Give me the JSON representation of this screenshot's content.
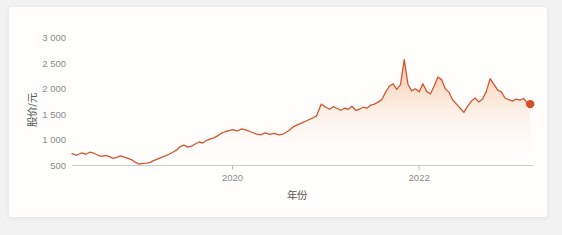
{
  "card": {
    "background": "#fffefd",
    "border_color": "#efeae6"
  },
  "chart_data": {
    "type": "line",
    "title": "",
    "subtitle": "",
    "xlabel": "年份",
    "ylabel": "股价/元",
    "xlim": [
      2018.28,
      2023.22
    ],
    "ylim": [
      500,
      3150
    ],
    "grid": false,
    "legend": null,
    "line_color": "#d1562f",
    "fill_gradient": [
      "#f2b089",
      "#ffffff"
    ],
    "end_marker": {
      "shape": "circle",
      "color": "#d1502a",
      "x": 2023.19,
      "y": 1700
    },
    "y_ticks": [
      500,
      1000,
      1500,
      2000,
      2500,
      3000
    ],
    "y_tick_labels": [
      "500",
      "1 000",
      "1 500",
      "2 000",
      "2 500",
      "3 000"
    ],
    "x_ticks": [
      2020,
      2022
    ],
    "x_tick_labels": [
      "2020",
      "2022"
    ],
    "series": [
      {
        "name": "股价",
        "x": [
          2018.28,
          2018.33,
          2018.38,
          2018.43,
          2018.47,
          2018.52,
          2018.56,
          2018.6,
          2018.64,
          2018.68,
          2018.72,
          2018.76,
          2018.8,
          2018.84,
          2018.88,
          2018.92,
          2018.96,
          2019.0,
          2019.04,
          2019.08,
          2019.12,
          2019.16,
          2019.2,
          2019.24,
          2019.28,
          2019.32,
          2019.36,
          2019.4,
          2019.44,
          2019.48,
          2019.52,
          2019.56,
          2019.6,
          2019.64,
          2019.68,
          2019.72,
          2019.76,
          2019.8,
          2019.84,
          2019.88,
          2019.92,
          2019.96,
          2020.0,
          2020.05,
          2020.1,
          2020.15,
          2020.2,
          2020.25,
          2020.3,
          2020.35,
          2020.4,
          2020.45,
          2020.5,
          2020.55,
          2020.6,
          2020.65,
          2020.7,
          2020.75,
          2020.8,
          2020.85,
          2020.9,
          2020.95,
          2021.0,
          2021.04,
          2021.08,
          2021.12,
          2021.16,
          2021.2,
          2021.24,
          2021.28,
          2021.32,
          2021.36,
          2021.4,
          2021.44,
          2021.48,
          2021.52,
          2021.56,
          2021.6,
          2021.64,
          2021.68,
          2021.72,
          2021.76,
          2021.8,
          2021.84,
          2021.88,
          2021.92,
          2021.96,
          2022.0,
          2022.04,
          2022.08,
          2022.12,
          2022.16,
          2022.2,
          2022.24,
          2022.28,
          2022.32,
          2022.36,
          2022.4,
          2022.44,
          2022.48,
          2022.52,
          2022.56,
          2022.6,
          2022.64,
          2022.68,
          2022.72,
          2022.76,
          2022.8,
          2022.84,
          2022.88,
          2022.92,
          2022.96,
          2023.0,
          2023.04,
          2023.08,
          2023.12,
          2023.16,
          2023.19
        ],
        "values": [
          730,
          700,
          745,
          720,
          760,
          735,
          700,
          680,
          700,
          672,
          640,
          660,
          690,
          665,
          640,
          612,
          560,
          528,
          540,
          545,
          560,
          600,
          630,
          660,
          690,
          720,
          760,
          800,
          870,
          900,
          860,
          880,
          920,
          960,
          940,
          990,
          1015,
          1040,
          1080,
          1130,
          1160,
          1180,
          1200,
          1175,
          1215,
          1190,
          1155,
          1120,
          1100,
          1140,
          1110,
          1130,
          1100,
          1120,
          1180,
          1255,
          1300,
          1340,
          1380,
          1420,
          1470,
          1700,
          1640,
          1600,
          1650,
          1620,
          1580,
          1620,
          1600,
          1660,
          1580,
          1600,
          1640,
          1620,
          1680,
          1700,
          1740,
          1790,
          1930,
          2050,
          2100,
          1990,
          2080,
          2570,
          2090,
          1960,
          2000,
          1940,
          2100,
          1950,
          1900,
          2050,
          2230,
          2180,
          2000,
          1930,
          1780,
          1700,
          1620,
          1540,
          1660,
          1760,
          1820,
          1740,
          1800,
          1950,
          2200,
          2090,
          1980,
          1940,
          1820,
          1790,
          1760,
          1800,
          1780,
          1810,
          1720,
          1700
        ]
      }
    ]
  }
}
